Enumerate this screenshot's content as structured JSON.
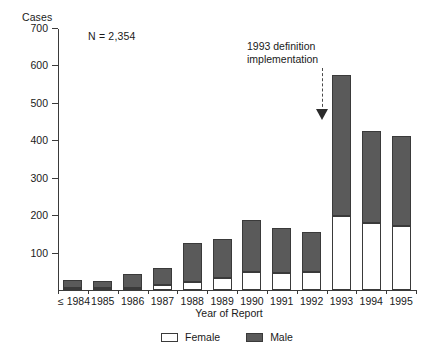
{
  "chart_data": {
    "type": "bar",
    "subtype": "stacked-vertical",
    "title": "",
    "xlabel": "Year of Report",
    "ylabel": "Cases",
    "ylim": [
      0,
      700
    ],
    "yticks": [
      0,
      100,
      200,
      300,
      400,
      500,
      600,
      700
    ],
    "ytick_labels": [
      "",
      "100",
      "200",
      "300",
      "400",
      "500",
      "600",
      "700"
    ],
    "grid": false,
    "legend_position": "bottom-center",
    "categories": [
      "≤ 1984",
      "1985",
      "1986",
      "1987",
      "1988",
      "1989",
      "1990",
      "1991",
      "1992",
      "1993",
      "1994",
      "1995"
    ],
    "series": [
      {
        "name": "Female",
        "color": "#ffffff",
        "values": [
          4,
          3,
          6,
          13,
          22,
          33,
          48,
          45,
          48,
          197,
          180,
          172
        ]
      },
      {
        "name": "Male",
        "color": "#5a5a5a",
        "values": [
          21,
          19,
          36,
          47,
          103,
          102,
          139,
          122,
          108,
          378,
          245,
          240
        ]
      }
    ],
    "totals": [
      25,
      22,
      42,
      60,
      125,
      135,
      187,
      167,
      156,
      575,
      425,
      412
    ],
    "annotations": [
      {
        "name": "sample-size",
        "text": "N = 2,354"
      },
      {
        "name": "definition-note",
        "text_line1": "1993 definition",
        "text_line2": "implementation",
        "points_to": "1993"
      }
    ]
  },
  "legend": {
    "items": [
      {
        "label": "Female",
        "swatch": "white-square"
      },
      {
        "label": "Male",
        "swatch": "dark-gray-square"
      }
    ]
  },
  "colors": {
    "male_fill": "#5a5a5a",
    "female_fill": "#ffffff",
    "outline": "#3a3a3a",
    "text": "#1a1a1a"
  }
}
